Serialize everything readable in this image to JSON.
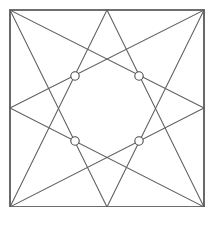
{
  "figure": {
    "background_color": "#ffffff",
    "canvas": {
      "width": 211,
      "height": 243
    },
    "bottom_margin_height": 36
  },
  "frame": {
    "name": "outer-square",
    "stroke_color": "#5a5a5a",
    "stroke_width": 1.6,
    "left": 10,
    "top": 10,
    "right": 204,
    "bottom": 207,
    "corners": {
      "top_left": {
        "x": 10,
        "y": 10
      },
      "top_right": {
        "x": 204,
        "y": 10
      },
      "bottom_right": {
        "x": 204,
        "y": 207
      },
      "bottom_left": {
        "x": 10,
        "y": 207
      }
    },
    "path": "M 10 10 L 204 10 L 204 207 L 10 207 Z"
  },
  "edge_midpoints": {
    "top": {
      "x": 107,
      "y": 10
    },
    "bottom": {
      "x": 107,
      "y": 207
    },
    "left": {
      "x": 10,
      "y": 108
    },
    "right": {
      "x": 204,
      "y": 108
    }
  },
  "triangles": [
    {
      "name": "triangle-apex-top",
      "apex": {
        "x": 107,
        "y": 10
      },
      "base": [
        {
          "x": 10,
          "y": 207
        },
        {
          "x": 204,
          "y": 207
        }
      ],
      "path": "M 107 10 L 10 207 L 204 207 Z",
      "stroke_color": "#5f5f5f"
    },
    {
      "name": "triangle-apex-bottom",
      "apex": {
        "x": 107,
        "y": 207
      },
      "base": [
        {
          "x": 10,
          "y": 10
        },
        {
          "x": 204,
          "y": 10
        }
      ],
      "path": "M 107 207 L 10 10 L 204 10 Z",
      "stroke_color": "#5f5f5f"
    },
    {
      "name": "triangle-apex-left",
      "apex": {
        "x": 10,
        "y": 108
      },
      "base": [
        {
          "x": 204,
          "y": 10
        },
        {
          "x": 204,
          "y": 207
        }
      ],
      "path": "M 10 108 L 204 10 L 204 207 Z",
      "stroke_color": "#5f5f5f"
    },
    {
      "name": "triangle-apex-right",
      "apex": {
        "x": 204,
        "y": 108
      },
      "base": [
        {
          "x": 10,
          "y": 10
        },
        {
          "x": 10,
          "y": 207
        }
      ],
      "path": "M 204 108 L 10 10 L 10 207 Z",
      "stroke_color": "#5f5f5f"
    }
  ],
  "marked_nodes": {
    "count": 4,
    "radius": 4.2,
    "fill": "#ffffff",
    "stroke": "#4a4a4a",
    "points": [
      {
        "name": "node-upper-left",
        "x": 75,
        "y": 76
      },
      {
        "name": "node-upper-right",
        "x": 139,
        "y": 76
      },
      {
        "name": "node-lower-left",
        "x": 75,
        "y": 141
      },
      {
        "name": "node-lower-right",
        "x": 139,
        "y": 141
      }
    ]
  }
}
